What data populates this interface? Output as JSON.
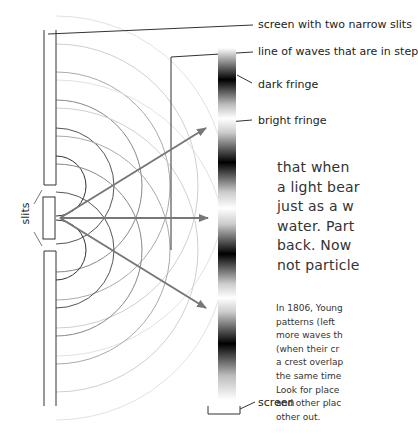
{
  "labels": {
    "screen_slits": "screen with two narrow slits",
    "waves_in_step": "line of waves that are in step",
    "dark_fringe": "dark fringe",
    "bright_fringe": "bright fringe",
    "screen": "screen",
    "slits": "slits"
  },
  "body_text": {
    "lines": [
      "that when",
      "a light bear",
      "just as a w",
      "water. Part",
      "back. Now",
      "not particle"
    ]
  },
  "caption": {
    "lines": [
      "In 1806, Young",
      "patterns (left",
      "more waves th",
      "(when their cr",
      "a crest overlap",
      "the same time",
      "Look for place",
      "and other plac",
      "other out."
    ]
  },
  "colors": {
    "line": "#333333",
    "arrow": "#777777",
    "wave_dark": "#444444",
    "wave_light": "#cfcfcf"
  }
}
